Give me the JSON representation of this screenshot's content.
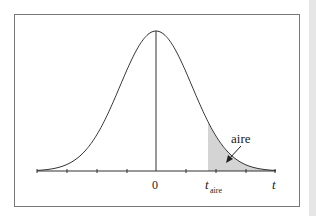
{
  "figure": {
    "type": "t-distribution density with shaded right tail",
    "labels": {
      "zero": "0",
      "t_axis": "t",
      "t_crit_main": "t",
      "t_crit_sub": "aire",
      "area": "aire"
    },
    "colors": {
      "curve": "#333333",
      "shade": "#d4d4d4",
      "frame": "#777777",
      "axis": "#333333",
      "strip": "#e6e6e6"
    },
    "axis": {
      "tick_count_left": 4,
      "tick_count_right": 4
    }
  }
}
